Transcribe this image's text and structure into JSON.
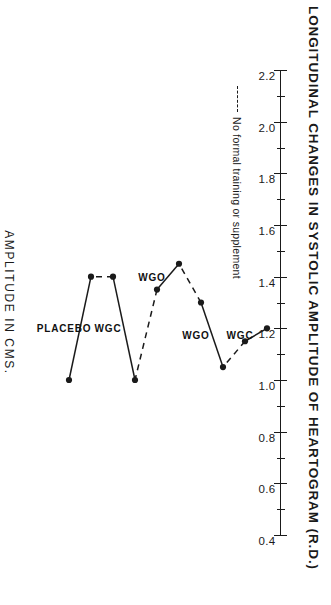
{
  "figure": {
    "title": "LONGITUDINAL CHANGES IN SYSTOLIC AMPLITUDE OF HEARTOGRAM (R.D.)",
    "legend_label": "No formal training or supplement",
    "legend_dash_style": "dashed",
    "ink_color": "#1a1a1a"
  },
  "chart_data": {
    "type": "line",
    "title": "LONGITUDINAL CHANGES IN SYSTOLIC AMPLITUDE OF HEARTOGRAM (R.D.)",
    "xlabel": "",
    "ylabel": "AMPLITUDE IN CMS.",
    "ylim": [
      0.4,
      2.2
    ],
    "ytick_labels": [
      "2.2",
      "2.0",
      "1.8",
      "1.6",
      "1.4",
      "1.2",
      "1.0",
      "0.8",
      "0.6",
      "0.4"
    ],
    "yticks": [
      2.2,
      2.0,
      1.8,
      1.6,
      1.4,
      1.2,
      1.0,
      0.8,
      0.6,
      0.4
    ],
    "grid": false,
    "legend_position": "upper-left",
    "x": [
      1,
      2,
      3,
      4,
      5,
      6,
      7,
      8,
      9,
      10
    ],
    "values": [
      1.2,
      1.15,
      1.05,
      1.3,
      1.45,
      1.35,
      1.0,
      1.4,
      1.4,
      1.0
    ],
    "segment_styles": [
      "solid",
      "dashed",
      "solid",
      "dashed",
      "solid",
      "dashed",
      "solid",
      "dashed",
      "solid"
    ],
    "annotations": [
      {
        "text": "WGC",
        "at_x": 1.5
      },
      {
        "text": "WGO",
        "at_x": 3.5
      },
      {
        "text": "WGO",
        "at_x": 5.5
      },
      {
        "text": "WGC",
        "at_x": 7.5
      },
      {
        "text": "PLACEBO",
        "at_x": 9.5
      }
    ]
  }
}
